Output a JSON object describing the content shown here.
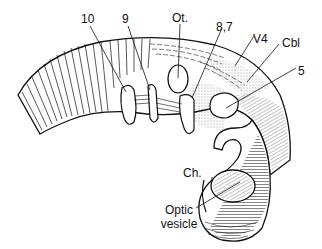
{
  "figure": {
    "labels": [
      {
        "id": "label-10",
        "text": "10"
      },
      {
        "id": "label-9",
        "text": "9"
      },
      {
        "id": "label-ot",
        "text": "Ot."
      },
      {
        "id": "label-8-7",
        "text": "8,7"
      },
      {
        "id": "label-v4",
        "text": "V4"
      },
      {
        "id": "label-cbl",
        "text": "Cbl"
      },
      {
        "id": "label-5",
        "text": "5"
      },
      {
        "id": "label-ch",
        "text": "Ch."
      },
      {
        "id": "label-optic-1",
        "text": "Optic"
      },
      {
        "id": "label-optic-2",
        "text": "vesicle"
      }
    ],
    "colors": {
      "ink": "#111111",
      "background": "#ffffff"
    }
  }
}
